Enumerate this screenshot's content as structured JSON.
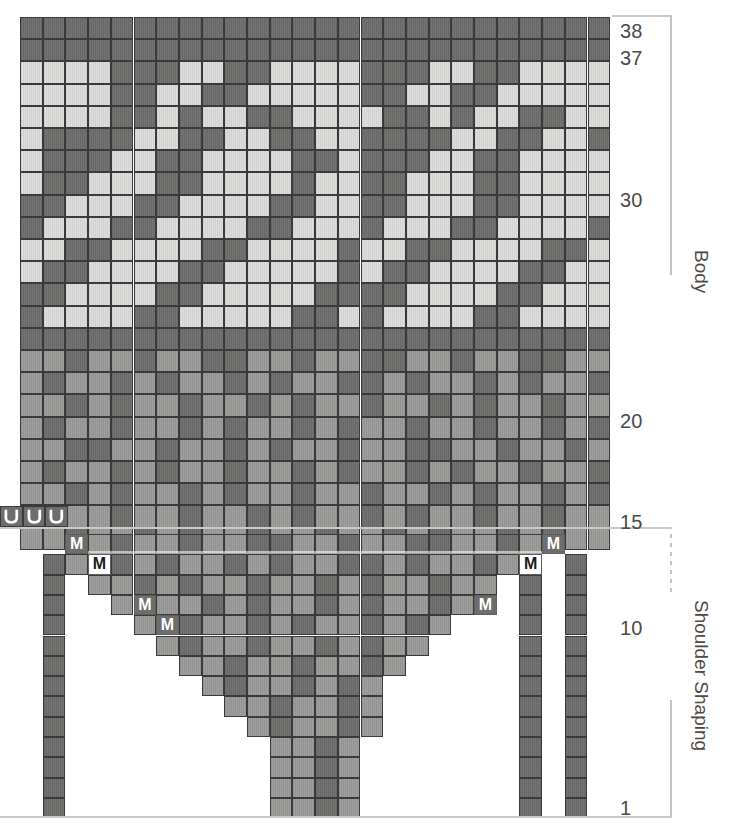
{
  "chart_data": {
    "type": "heatmap",
    "grid": {
      "columns": 26,
      "rows": 38,
      "cell_px": 22.7
    },
    "legend": {
      "light": "#dcdcda",
      "mid": "#9a9a98",
      "dark": "#6d6d6b",
      "deep": "#58585a"
    },
    "sections": [
      {
        "label": "Body",
        "row_start": 15,
        "row_end": 38
      },
      {
        "label": "Shoulder Shaping",
        "row_start": 1,
        "row_end": 14
      }
    ],
    "row_labels": [
      "38",
      "37",
      "30",
      "20",
      "15",
      "10",
      "1"
    ],
    "symbols": {
      "make_one": "M",
      "purl": "U"
    },
    "marker_count_M": 8,
    "marker_count_U": 3,
    "xlabel": "",
    "ylabel": "Row",
    "ylim": [
      1,
      38
    ],
    "body_rows": [
      "DDDDDDDDDDDDDDDDDDDDDDDDDD",
      "DDDDDDDDDDDDDDDDDDDDDDDDDD",
      "LLLLDDDLLDDLLLLDDDLLDDLLLL",
      "LLLLDDLLDDLLLLLDDLLDDLLLLL",
      "LLLLDDLDLLDDLLLLDDLDLLDDLL",
      "LDDDDLLDDLLDDLLDDDDLLDDLLD",
      "LDDDLLDDLLLLDDLDDDLLDDLLLL",
      "LDDLLLDDLLLLDLLDDLLLDDLLLL",
      "DDLLLDDLLLLDDLLDDLLLDDLLLL",
      "DLLLDDLLLLDDLLLDLLLDDLLLLD",
      "LLDDLLLLDDLLLLDLLDDLLLLDDL",
      "LDDLLLLDDLLLLLDLDDLLLLDDLL",
      "DDLLLLDDLLLLLDDDDLLLLDDLLL",
      "DLLLLDDLLLLLDDLDLLLLDDLLLL",
      "DDDDDDDDDDDDDDDDDDDDDDDDDD",
      "MMDMMDMMDDMMDMMDDMMDMMDDMM",
      "MDMMDMDMMDMDMMDDMDMMDMDMMD",
      "MMDMDMMDMMDMDMMDMMDMDMMDMM",
      "MDMMDMMDMDMMDMDMMDMMDMMDMD",
      "MMDDMMDMMDMDMMDMMDDMMDMMDM",
      "MDMMDMDMMDMMDMDMMDMDMMDMMD",
      "MMDMDMMDMDMMDMMDMMDMDMMDMD",
      "MDMMDMMDMMDMDMMDMDMMDMMDMM",
      "MMDMMDMDMMDMMDMMDMDMMDMDMM"
    ],
    "shoulder_rows": [
      "..MMDMMDMMDDMMDMMDDMMDMM..",
      ".DMMDMDMMDMDMMDDMDMMDMD.D.",
      ".D.MMDMDMMDMMDMDMMDMM.D.D.",
      ".D..MDMMDMDMMDMDMMDM..D.D.",
      ".D...MMDMMDMDMMDMDM...D.D.",
      ".D....MDMMDMMDMDMM....D.D.",
      ".D.....MMDMMDMMDM.....D.D.",
      ".D......MDMMDMDM......D.D.",
      ".D.......MMDMMDM......D.D.",
      ".D........MDMMDM......D.D.",
      ".D.........MMDM.......D.D.",
      ".D.........MMDM.......D.D.",
      ".D.........MMDM.......D.D.",
      ".D.........MMDM.......D.D."
    ]
  },
  "labels": {
    "r38": "38",
    "r37": "37",
    "r30": "30",
    "r20": "20",
    "r15": "15",
    "r10": "10",
    "r1": "1",
    "body": "Body",
    "shoulder": "Shoulder Shaping",
    "m": "M"
  }
}
